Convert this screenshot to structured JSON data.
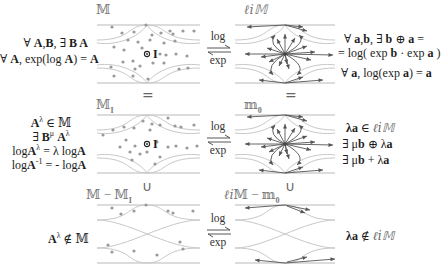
{
  "row1": {
    "left_label": "𝕄",
    "right_label": "ℓ𝑖𝕄",
    "left_text": [
      "∀ A,B, ∃ BA",
      "∀ A, exp(log A) = A"
    ],
    "right_text": [
      "∀ a,b, ∃ b ⊕ a =",
      "= log( exp b exp a )",
      "∀ a, log(exp a) = a"
    ],
    "identity_label": "I",
    "map_top": "log",
    "map_bottom": "exp"
  },
  "row2": {
    "relation_symbol": "=",
    "left_label": "𝕄_I",
    "right_label": "𝕞₀",
    "left_text": [
      "A^λ ∈ 𝕄",
      "∃ B^μ A^λ",
      "logA^λ = λ logA",
      "logA⁻¹ = - logA"
    ],
    "right_text": [
      "λa ∈ ℓ𝑖𝕄",
      "∃ μb ⊕ λa",
      "∃ μb + λa"
    ],
    "identity_label": "I",
    "map_top": "log",
    "map_bottom": "exp"
  },
  "row3": {
    "relation_symbol": "∪",
    "left_label": "𝕄 − 𝕄_I",
    "right_label": "ℓ𝑖𝕄 − 𝕞₀",
    "left_text": [
      "A^λ ∉ 𝕄"
    ],
    "right_text": [
      "λa ∉ ℓ𝑖𝕄"
    ],
    "map_top": "log",
    "map_bottom": "exp"
  },
  "icons": {
    "map_arrows": "harpoon-pair-icon",
    "identity_point": "circle-dot-icon"
  },
  "colors": {
    "boundary": "#b9b9b9",
    "dot": "#9a9a9a",
    "vector": "#555555",
    "text": "#1e1e1e"
  }
}
